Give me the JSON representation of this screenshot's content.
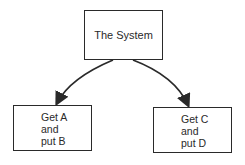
{
  "diagram": {
    "root": {
      "label": "The System"
    },
    "children": [
      {
        "lines": [
          "Get A",
          "and",
          "put B"
        ]
      },
      {
        "lines": [
          "Get C",
          "and",
          "put D"
        ]
      }
    ],
    "colors": {
      "stroke": "#2a2a2a",
      "background": "#ffffff"
    }
  }
}
